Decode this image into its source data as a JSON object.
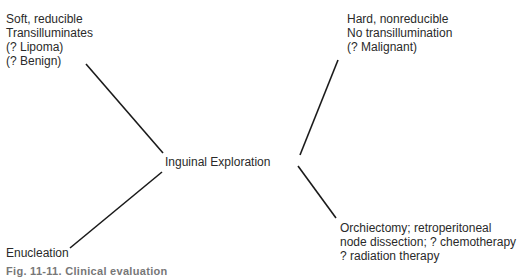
{
  "diagram": {
    "center": {
      "label": "Inguinal Exploration"
    },
    "nodes": [
      {
        "id": "top-left",
        "lines": [
          "Soft, reducible",
          "Transilluminates",
          "(? Lipoma)",
          "(? Benign)"
        ]
      },
      {
        "id": "top-right",
        "lines": [
          "Hard, nonreducible",
          "No transillumination",
          "(? Malignant)"
        ]
      },
      {
        "id": "bottom-left",
        "lines": [
          "Enucleation"
        ]
      },
      {
        "id": "bottom-right",
        "lines": [
          "Orchiectomy; retroperitoneal",
          "node dissection; ? chemotherapy",
          "? radiation therapy"
        ]
      }
    ],
    "caption": "Fig. 11-11. Clinical evaluation"
  },
  "colors": {
    "line": "#1a1a1a",
    "text": "#2a2a2a",
    "background": "#ffffff"
  }
}
